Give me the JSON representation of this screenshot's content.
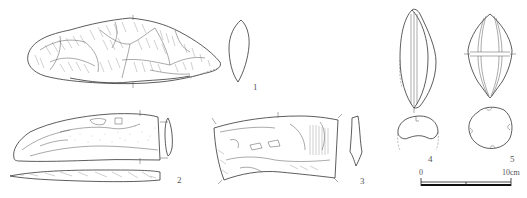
{
  "figure": {
    "type": "archaeological artifact line drawings",
    "artifacts": [
      {
        "number": "1",
        "label": "1",
        "description": "large flaked stone tool with cross-section"
      },
      {
        "number": "2",
        "label": "2",
        "description": "curved elongated tool, face, section and side profile"
      },
      {
        "number": "3",
        "label": "3",
        "description": "curved flaked block with section"
      },
      {
        "number": "4",
        "label": "4",
        "description": "spindle-shaped object with grooved axis and cross-section"
      },
      {
        "number": "5",
        "label": "5",
        "description": "spindle-shaped object with girdle groove and round cross-section"
      }
    ],
    "scale_bar": {
      "start_label": "0",
      "end_label": "10cm"
    }
  }
}
